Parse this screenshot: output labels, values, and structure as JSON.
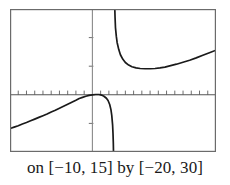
{
  "figure": {
    "caption": "on [−10, 15] by [−20, 30]",
    "caption_prefix": "on",
    "x_domain_label": "[−10, 15]",
    "joiner": "by",
    "y_range_label": "[−20, 30]",
    "frame_color": "#6b6b6b",
    "axis_color": "#7a7a7a",
    "curve_color": "#1a1a1a",
    "background_color": "#ffffff"
  },
  "chart_data": {
    "type": "line",
    "title": "",
    "subtitle": "",
    "xlabel": "",
    "ylabel": "",
    "xlim": [
      -10,
      15
    ],
    "ylim": [
      -20,
      30
    ],
    "grid": false,
    "legend": "none",
    "axes": {
      "x_axis_at_y": 0,
      "y_axis_at_x": 0,
      "x_tick_interval": 1,
      "y_tick_interval": 10,
      "x_ticks": [
        -10,
        -9,
        -8,
        -7,
        -6,
        -5,
        -4,
        -3,
        -2,
        -1,
        0,
        1,
        2,
        3,
        4,
        5,
        6,
        7,
        8,
        9,
        10,
        11,
        12,
        13,
        14,
        15
      ],
      "y_ticks": [
        -20,
        -10,
        0,
        10,
        20,
        30
      ],
      "tick_labels_shown": false
    },
    "asymptotes": {
      "vertical": [
        2.6
      ],
      "note": "curve breaks at vertical asymptote near x = 2.6"
    },
    "series": [
      {
        "name": "left-branch",
        "comment": "enters at left edge below axis, rises to cross near x = 0, then plunges to -20 at the asymptote",
        "points": [
          [
            -10.0,
            -11.8
          ],
          [
            -9.5,
            -11.3
          ],
          [
            -9.0,
            -10.8
          ],
          [
            -8.5,
            -10.2
          ],
          [
            -8.0,
            -9.7
          ],
          [
            -7.5,
            -9.1
          ],
          [
            -7.0,
            -8.5
          ],
          [
            -6.5,
            -7.9
          ],
          [
            -6.0,
            -7.3
          ],
          [
            -5.5,
            -6.7
          ],
          [
            -5.0,
            -6.0
          ],
          [
            -4.5,
            -5.4
          ],
          [
            -4.0,
            -4.7
          ],
          [
            -3.5,
            -4.0
          ],
          [
            -3.0,
            -3.3
          ],
          [
            -2.5,
            -2.6
          ],
          [
            -2.0,
            -1.9
          ],
          [
            -1.6,
            -1.3
          ],
          [
            -1.2,
            -0.9
          ],
          [
            -0.8,
            -0.5
          ],
          [
            -0.4,
            -0.2
          ],
          [
            0.0,
            0.0
          ],
          [
            0.4,
            0.1
          ],
          [
            0.8,
            0.1
          ],
          [
            1.1,
            -0.1
          ],
          [
            1.4,
            -0.5
          ],
          [
            1.7,
            -1.2
          ],
          [
            1.9,
            -2.0
          ],
          [
            2.1,
            -3.4
          ],
          [
            2.25,
            -5.2
          ],
          [
            2.35,
            -7.2
          ],
          [
            2.45,
            -10.5
          ],
          [
            2.5,
            -13.5
          ],
          [
            2.54,
            -17.0
          ],
          [
            2.56,
            -20.0
          ]
        ]
      },
      {
        "name": "right-branch",
        "comment": "descends from top of window at the asymptote, bottoms out near (7, 9), then rises to right edge",
        "points": [
          [
            2.72,
            30.0
          ],
          [
            2.75,
            27.0
          ],
          [
            2.8,
            23.5
          ],
          [
            2.9,
            20.5
          ],
          [
            3.0,
            18.3
          ],
          [
            3.2,
            15.8
          ],
          [
            3.4,
            14.0
          ],
          [
            3.7,
            12.4
          ],
          [
            4.0,
            11.3
          ],
          [
            4.4,
            10.4
          ],
          [
            4.8,
            9.8
          ],
          [
            5.3,
            9.4
          ],
          [
            5.8,
            9.2
          ],
          [
            6.4,
            9.1
          ],
          [
            7.0,
            9.1
          ],
          [
            7.6,
            9.2
          ],
          [
            8.2,
            9.4
          ],
          [
            8.8,
            9.7
          ],
          [
            9.5,
            10.2
          ],
          [
            10.2,
            10.7
          ],
          [
            11.0,
            11.4
          ],
          [
            11.8,
            12.1
          ],
          [
            12.6,
            12.9
          ],
          [
            13.4,
            13.8
          ],
          [
            14.2,
            14.7
          ],
          [
            15.0,
            15.6
          ]
        ]
      }
    ]
  }
}
